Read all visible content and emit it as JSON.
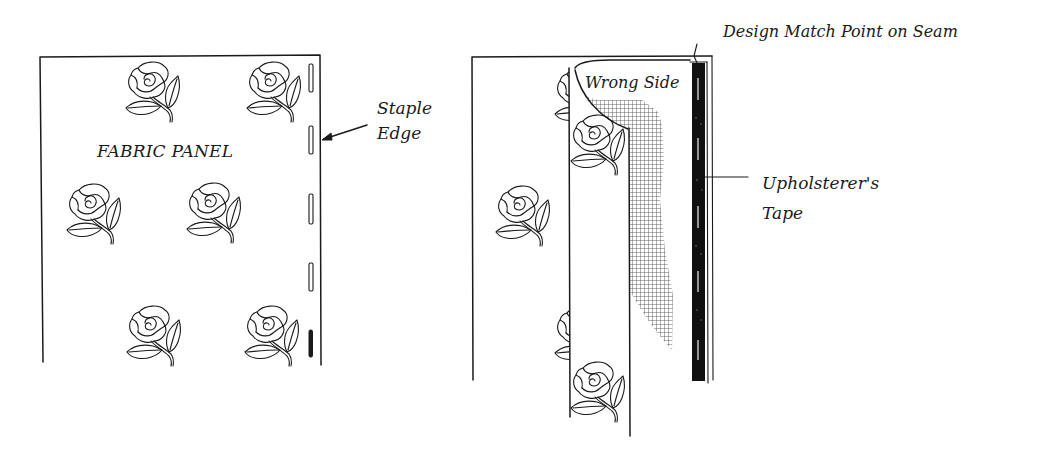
{
  "figure": {
    "left_panel": {
      "title": "FABRIC PANEL",
      "callout": {
        "line1": "Staple",
        "line2": "Edge"
      },
      "rose_count": 6,
      "staple_count": 5
    },
    "right_panel": {
      "flap_label": "Wrong Side",
      "top_callout": "Design Match Point on Seam",
      "side_callout": {
        "line1": "Upholsterer's",
        "line2": "Tape"
      },
      "rose_count": 5
    }
  },
  "colors": {
    "ink": "#1a1a1a",
    "background": "#ffffff",
    "tape": "#111111"
  }
}
